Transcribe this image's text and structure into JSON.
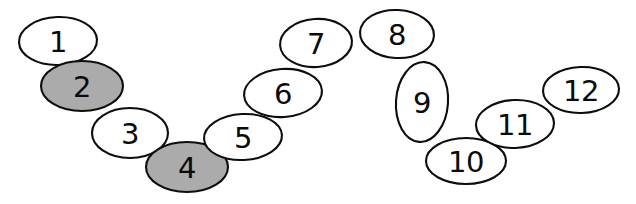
{
  "diagram": {
    "background_color": "#ffffff",
    "outline_color": "#0d0d0d",
    "fill_white": "#ffffff",
    "fill_gray": "#ababab",
    "canvas": {
      "width": 636,
      "height": 204
    },
    "nodes": [
      {
        "label": "1",
        "cx": 58,
        "cy": 41,
        "rx": 39,
        "ry": 24,
        "rotate": -2,
        "fill": "white",
        "font_size": 29
      },
      {
        "label": "2",
        "cx": 82,
        "cy": 86,
        "rx": 41,
        "ry": 25,
        "rotate": 0,
        "fill": "gray",
        "font_size": 29
      },
      {
        "label": "3",
        "cx": 130,
        "cy": 133,
        "rx": 38,
        "ry": 25,
        "rotate": 0,
        "fill": "white",
        "font_size": 29
      },
      {
        "label": "4",
        "cx": 187,
        "cy": 167,
        "rx": 41,
        "ry": 25,
        "rotate": 0,
        "fill": "gray",
        "font_size": 29
      },
      {
        "label": "5",
        "cx": 243,
        "cy": 137,
        "rx": 39,
        "ry": 23,
        "rotate": -3,
        "fill": "white",
        "font_size": 29
      },
      {
        "label": "6",
        "cx": 283,
        "cy": 93,
        "rx": 39,
        "ry": 24,
        "rotate": -4,
        "fill": "white",
        "font_size": 29
      },
      {
        "label": "7",
        "cx": 316,
        "cy": 43,
        "rx": 36,
        "ry": 24,
        "rotate": -4,
        "fill": "white",
        "font_size": 29
      },
      {
        "label": "8",
        "cx": 397,
        "cy": 34,
        "rx": 37,
        "ry": 24,
        "rotate": 3,
        "fill": "white",
        "font_size": 29
      },
      {
        "label": "9",
        "cx": 422,
        "cy": 102,
        "rx": 26,
        "ry": 40,
        "rotate": 4,
        "fill": "white",
        "font_size": 29
      },
      {
        "label": "10",
        "cx": 466,
        "cy": 161,
        "rx": 40,
        "ry": 23,
        "rotate": 0,
        "fill": "white",
        "font_size": 29
      },
      {
        "label": "11",
        "cx": 515,
        "cy": 124,
        "rx": 39,
        "ry": 24,
        "rotate": -2,
        "fill": "white",
        "font_size": 29
      },
      {
        "label": "12",
        "cx": 581,
        "cy": 90,
        "rx": 38,
        "ry": 23,
        "rotate": -2,
        "fill": "white",
        "font_size": 29
      }
    ]
  }
}
